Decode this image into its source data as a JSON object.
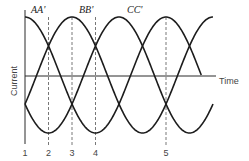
{
  "chart_data": {
    "type": "line",
    "title": "",
    "xlabel": "Time",
    "ylabel": "Current",
    "grid": false,
    "legend": "inline-top",
    "period": 3,
    "amplitude": 1,
    "x_range": [
      0,
      4.0
    ],
    "ylim": [
      -1,
      1
    ],
    "series": [
      {
        "name": "AA'",
        "peak_at": 0,
        "x_end": 3.75
      },
      {
        "name": "BB'",
        "peak_at": 1,
        "x_end": 4.0
      },
      {
        "name": "CC'",
        "peak_at": 2,
        "x_end": 4.0
      }
    ],
    "markers": [
      {
        "label": "1",
        "x": 0
      },
      {
        "label": "2",
        "x": 0.5
      },
      {
        "label": "3",
        "x": 1
      },
      {
        "label": "4",
        "x": 1.5
      },
      {
        "label": "5",
        "x": 3
      }
    ],
    "series_labels": [
      "AA'",
      "BB'",
      "CC'"
    ]
  }
}
